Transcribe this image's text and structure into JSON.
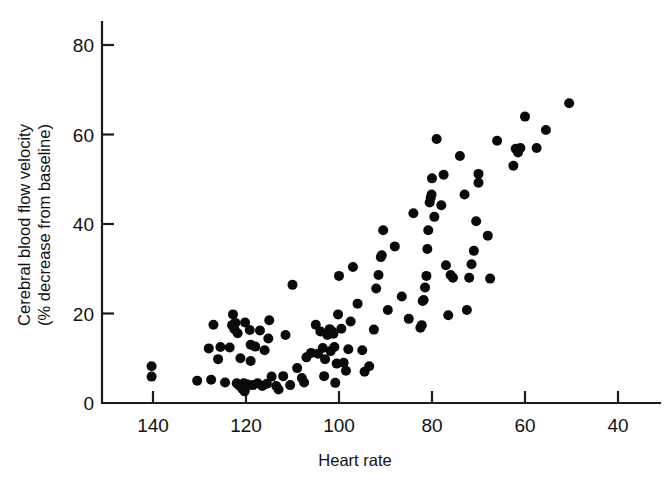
{
  "chart_data": {
    "type": "scatter",
    "title": "",
    "xlabel": "Heart rate",
    "ylabel_line1": "Cerebral blood flow velocity",
    "ylabel_line2": "(% decrease from baseline)",
    "x_ticks": [
      140,
      120,
      100,
      80,
      60,
      40
    ],
    "y_ticks": [
      0,
      20,
      40,
      60,
      80
    ],
    "xlim": [
      145,
      35
    ],
    "ylim": [
      0,
      85
    ],
    "x_axis_reversed": true,
    "grid": false,
    "legend": null,
    "marker": {
      "shape": "circle",
      "color": "#0a0a0a",
      "size_px": 10
    },
    "n_points": 125,
    "points": [
      [
        140.3,
        8.2
      ],
      [
        140.3,
        5.9
      ],
      [
        130.5,
        5.0
      ],
      [
        127.5,
        5.2
      ],
      [
        127.0,
        17.5
      ],
      [
        125.5,
        12.5
      ],
      [
        124.5,
        4.6
      ],
      [
        123.5,
        12.4
      ],
      [
        123.0,
        17.4
      ],
      [
        122.8,
        19.8
      ],
      [
        122.5,
        16.5
      ],
      [
        122.3,
        17.9
      ],
      [
        122.0,
        4.4
      ],
      [
        121.8,
        15.6
      ],
      [
        121.5,
        3.9
      ],
      [
        121.2,
        10.0
      ],
      [
        121.0,
        4.0
      ],
      [
        120.8,
        3.2
      ],
      [
        120.5,
        4.4
      ],
      [
        120.3,
        2.6
      ],
      [
        120.0,
        3.6
      ],
      [
        119.8,
        4.2
      ],
      [
        119.5,
        4.0
      ],
      [
        119.2,
        16.3
      ],
      [
        119.0,
        9.4
      ],
      [
        118.5,
        4.0
      ],
      [
        118.0,
        12.6
      ],
      [
        117.5,
        4.4
      ],
      [
        117.0,
        16.2
      ],
      [
        116.5,
        3.8
      ],
      [
        116.0,
        11.8
      ],
      [
        115.5,
        4.3
      ],
      [
        115.0,
        18.5
      ],
      [
        114.5,
        5.9
      ],
      [
        113.5,
        3.8
      ],
      [
        113.0,
        3.0
      ],
      [
        112.0,
        6.0
      ],
      [
        111.5,
        15.2
      ],
      [
        110.0,
        26.4
      ],
      [
        109.0,
        7.8
      ],
      [
        108.0,
        5.6
      ],
      [
        107.0,
        10.2
      ],
      [
        106.0,
        11.2
      ],
      [
        105.0,
        17.5
      ],
      [
        104.5,
        11.0
      ],
      [
        104.0,
        16.0
      ],
      [
        103.5,
        12.3
      ],
      [
        103.0,
        9.8
      ],
      [
        102.5,
        15.2
      ],
      [
        102.0,
        16.5
      ],
      [
        101.8,
        11.6
      ],
      [
        101.5,
        16.0
      ],
      [
        101.2,
        15.5
      ],
      [
        101.0,
        12.5
      ],
      [
        100.8,
        4.5
      ],
      [
        100.5,
        8.8
      ],
      [
        100.2,
        19.8
      ],
      [
        100.0,
        28.4
      ],
      [
        99.5,
        16.6
      ],
      [
        98.5,
        7.2
      ],
      [
        97.0,
        30.4
      ],
      [
        96.0,
        22.2
      ],
      [
        95.0,
        11.8
      ],
      [
        94.5,
        7.0
      ],
      [
        93.5,
        8.2
      ],
      [
        92.5,
        16.4
      ],
      [
        92.0,
        25.6
      ],
      [
        91.5,
        28.6
      ],
      [
        91.0,
        32.6
      ],
      [
        90.8,
        33.0
      ],
      [
        90.5,
        38.6
      ],
      [
        89.5,
        20.8
      ],
      [
        88.0,
        35.0
      ],
      [
        86.5,
        23.8
      ],
      [
        85.0,
        18.8
      ],
      [
        84.0,
        42.4
      ],
      [
        82.5,
        16.8
      ],
      [
        82.2,
        17.4
      ],
      [
        82.0,
        22.8
      ],
      [
        81.8,
        23.0
      ],
      [
        81.5,
        25.8
      ],
      [
        81.2,
        28.4
      ],
      [
        81.0,
        34.4
      ],
      [
        80.8,
        38.6
      ],
      [
        80.5,
        44.8
      ],
      [
        80.3,
        45.8
      ],
      [
        80.1,
        46.6
      ],
      [
        80.0,
        50.2
      ],
      [
        79.5,
        41.6
      ],
      [
        79.0,
        59.0
      ],
      [
        78.0,
        44.2
      ],
      [
        77.5,
        51.0
      ],
      [
        77.0,
        30.8
      ],
      [
        76.5,
        19.6
      ],
      [
        76.0,
        28.6
      ],
      [
        75.5,
        28.0
      ],
      [
        74.0,
        55.2
      ],
      [
        73.0,
        46.6
      ],
      [
        72.5,
        20.8
      ],
      [
        72.0,
        28.0
      ],
      [
        71.5,
        31.0
      ],
      [
        71.0,
        34.0
      ],
      [
        70.5,
        40.6
      ],
      [
        70.0,
        49.2
      ],
      [
        70.0,
        51.2
      ],
      [
        68.0,
        37.4
      ],
      [
        67.5,
        27.8
      ],
      [
        66.0,
        58.6
      ],
      [
        62.5,
        53.0
      ],
      [
        62.0,
        56.8
      ],
      [
        61.5,
        56.0
      ],
      [
        61.0,
        57.0
      ],
      [
        60.0,
        64.0
      ],
      [
        57.5,
        57.0
      ],
      [
        55.5,
        61.0
      ],
      [
        50.5,
        67.0
      ],
      [
        97.5,
        18.2
      ],
      [
        98.0,
        12.0
      ],
      [
        99.0,
        9.0
      ],
      [
        103.2,
        6.0
      ],
      [
        126.0,
        9.8
      ],
      [
        128.0,
        12.2
      ],
      [
        119.0,
        13.0
      ],
      [
        120.2,
        18.0
      ],
      [
        115.2,
        14.4
      ],
      [
        110.5,
        4.0
      ],
      [
        107.5,
        4.6
      ]
    ]
  },
  "axes": {
    "x_tick_labels": [
      "140",
      "120",
      "100",
      "80",
      "60",
      "40"
    ],
    "y_tick_labels": [
      "0",
      "20",
      "40",
      "60",
      "80"
    ]
  }
}
